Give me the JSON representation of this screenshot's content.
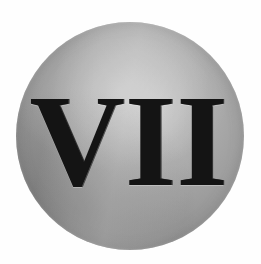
{
  "image": {
    "kind": "scanned-halftone-illustration",
    "subject": "gray sphere with roman numeral",
    "background_color": "#fefefe",
    "width": 261,
    "height": 264
  },
  "disc": {
    "shape": "circle",
    "center_x": 130,
    "center_y": 136,
    "diameter": 228,
    "fill_light": "#b9b9b9",
    "fill_mid": "#8f8f8f",
    "fill_dark": "#787878",
    "highlight_color": "#c4c4c4",
    "shadow_color": "#6e6e6e",
    "texture": "halftone-dots"
  },
  "numeral": {
    "value": "VII",
    "arabic_equivalent": "7",
    "color": "#141414",
    "style": "bold-serif",
    "left": 79,
    "top": 93,
    "right": 179,
    "bottom": 196
  }
}
